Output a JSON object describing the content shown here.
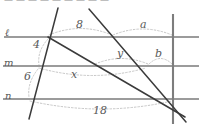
{
  "figure": {
    "title_strip": "partially cropped text row at top of image",
    "width": 199,
    "height": 127,
    "background": "#ffffff",
    "line_color": "#6e6e6e",
    "transversal_color": "#3a3a3a",
    "arc_color": "#b9b9b9",
    "label_color": "#4a4a4a"
  },
  "parallel_lines": [
    {
      "name": "l",
      "label": "ℓ",
      "y": 37,
      "label_x": 5,
      "label_y": 30
    },
    {
      "name": "m",
      "label": "m",
      "y": 66,
      "label_x": 4,
      "label_y": 60
    },
    {
      "name": "n",
      "label": "n",
      "y": 99,
      "label_x": 5,
      "label_y": 93
    }
  ],
  "segment_labels": [
    {
      "id": "seg-4",
      "text": "4",
      "x": 33,
      "y": 44
    },
    {
      "id": "seg-6",
      "text": "6",
      "x": 24,
      "y": 76
    },
    {
      "id": "seg-8",
      "text": "8",
      "x": 76,
      "y": 24
    },
    {
      "id": "seg-18",
      "text": "18",
      "x": 95,
      "y": 110
    }
  ],
  "variable_labels": [
    {
      "id": "var-a",
      "text": "a",
      "x": 140,
      "y": 24
    },
    {
      "id": "var-b",
      "text": "b",
      "x": 155,
      "y": 53
    },
    {
      "id": "var-x",
      "text": "x",
      "x": 71,
      "y": 73
    },
    {
      "id": "var-y",
      "text": "y",
      "x": 117,
      "y": 53
    }
  ],
  "vertical_line": {
    "x": 173,
    "y_top": 14,
    "y_bottom": 124
  },
  "transversals": [
    {
      "id": "steep-left",
      "x1": 58,
      "y1": 8,
      "x2": 29,
      "y2": 119
    },
    {
      "id": "diagonal-upper",
      "x1": 89,
      "y1": 9,
      "x2": 186,
      "y2": 122
    },
    {
      "id": "diagonal-lower",
      "x1": 48,
      "y1": 37,
      "x2": 185,
      "y2": 117
    }
  ],
  "arcs": [
    {
      "id": "arc-8",
      "x1": 49,
      "y1": 35,
      "x2": 112,
      "y2": 35,
      "bulge": -13
    },
    {
      "id": "arc-a",
      "x1": 113,
      "y1": 35,
      "x2": 172,
      "y2": 35,
      "bulge": -12
    },
    {
      "id": "arc-y",
      "x1": 95,
      "y1": 64,
      "x2": 148,
      "y2": 64,
      "bulge": -11
    },
    {
      "id": "arc-b",
      "x1": 149,
      "y1": 64,
      "x2": 172,
      "y2": 64,
      "bulge": -11
    },
    {
      "id": "arc-x",
      "x1": 39,
      "y1": 68,
      "x2": 146,
      "y2": 68,
      "bulge": 15
    },
    {
      "id": "arc-4",
      "x1": 48,
      "y1": 38,
      "x2": 39,
      "y2": 65,
      "bulge": 9
    },
    {
      "id": "arc-6",
      "x1": 38,
      "y1": 68,
      "x2": 29,
      "y2": 97,
      "bulge": 9
    },
    {
      "id": "arc-18",
      "x1": 30,
      "y1": 101,
      "x2": 172,
      "y2": 101,
      "bulge": 16
    }
  ],
  "top_fragments": [
    {
      "text": "—",
      "x": 6
    },
    {
      "text": "—",
      "x": 18
    },
    {
      "text": "—",
      "x": 30
    },
    {
      "text": "—",
      "x": 42
    },
    {
      "text": "—",
      "x": 54
    },
    {
      "text": "—",
      "x": 66
    },
    {
      "text": "—",
      "x": 78
    },
    {
      "text": "—",
      "x": 90
    },
    {
      "text": "—",
      "x": 102
    }
  ]
}
